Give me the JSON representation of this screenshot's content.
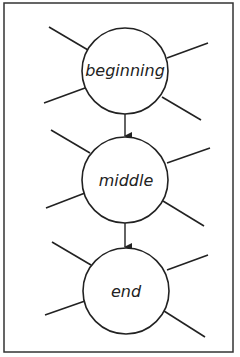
{
  "diagram": {
    "type": "story-structure web",
    "nodes": [
      {
        "id": "beginning",
        "label": "beginning"
      },
      {
        "id": "middle",
        "label": "middle"
      },
      {
        "id": "end",
        "label": "end"
      }
    ],
    "edges": [
      {
        "from": "beginning",
        "to": "middle"
      },
      {
        "from": "middle",
        "to": "end"
      }
    ],
    "spokes_per_node": 4,
    "colors": {
      "stroke": "#222222",
      "background": "#ffffff"
    }
  }
}
